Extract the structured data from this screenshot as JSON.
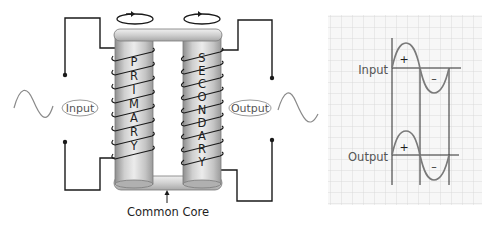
{
  "diagram": {
    "type": "transformer",
    "labels": {
      "input": "Input",
      "output": "Output",
      "core": "Common Core",
      "primary_letters": [
        "P",
        "R",
        "I",
        "M",
        "A",
        "R",
        "Y"
      ],
      "secondary_letters": [
        "S",
        "E",
        "C",
        "O",
        "N",
        "D",
        "A",
        "R",
        "Y"
      ]
    },
    "graph": {
      "input_label": "Input",
      "output_label": "Output",
      "positive_sign": "+",
      "negative_sign": "–"
    },
    "colors": {
      "core_light": "#e4e4e4",
      "core_dark": "#9a9a9a",
      "wire": "#1a1a1a",
      "wave": "#8a8a8a",
      "grid": "#d6d6d6",
      "grid_bg": "#f6f6f6"
    }
  }
}
